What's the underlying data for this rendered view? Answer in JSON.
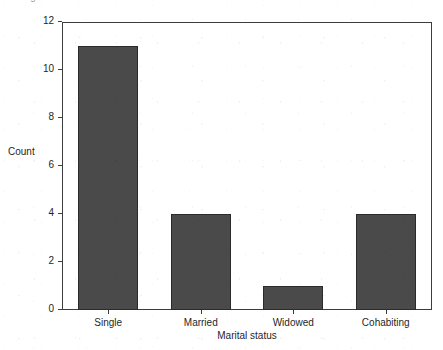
{
  "figure": {
    "cropped_title_fragment": "Figure ..... marital status",
    "background_color": "#ffffff",
    "frame_color": "#3c3c3c"
  },
  "chart_data": {
    "type": "bar",
    "title": "",
    "categories": [
      "Single",
      "Married",
      "Widowed",
      "Cohabiting"
    ],
    "values": [
      11,
      4,
      1,
      4
    ],
    "xlabel": "Marital status",
    "ylabel": "Count",
    "ylim": [
      0,
      12
    ],
    "yticks": [
      0,
      2,
      4,
      6,
      8,
      10,
      12
    ],
    "ytick_labels": [
      "0",
      "2",
      "4",
      "6",
      "8",
      "10",
      "12"
    ],
    "grid": false,
    "legend": false,
    "bar_color": "#4a4a4a",
    "bar_edge_color": "#2b2b2b"
  }
}
